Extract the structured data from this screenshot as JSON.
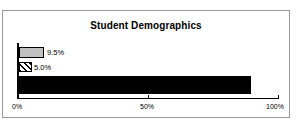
{
  "chart_data": {
    "type": "bar",
    "orientation": "horizontal",
    "title": "Student Demographics",
    "xlabel": "",
    "ylabel": "",
    "xlim": [
      0,
      100
    ],
    "grid": false,
    "legend": false,
    "categories": [
      "",
      "",
      ""
    ],
    "values": [
      9.5,
      5.0,
      89.2
    ],
    "data_labels": [
      "9.5%",
      "5.0%",
      "89.2%"
    ],
    "series": [
      {
        "name": "",
        "points": [
          {
            "value": 9.5,
            "label": "9.5%",
            "fill": "solid-gray",
            "color": "#c0c0c0"
          },
          {
            "value": 5.0,
            "label": "5.0%",
            "fill": "diagonal-hatch",
            "color": "#000000"
          },
          {
            "value": 89.2,
            "label": "89.2%",
            "fill": "solid-black",
            "color": "#000000"
          }
        ]
      }
    ],
    "xticks": [
      0,
      50,
      100
    ],
    "xtick_labels": [
      "0%",
      "50%",
      "100%"
    ]
  },
  "frame": {
    "border_color": "#9a9a9a",
    "background": "#ffffff"
  }
}
